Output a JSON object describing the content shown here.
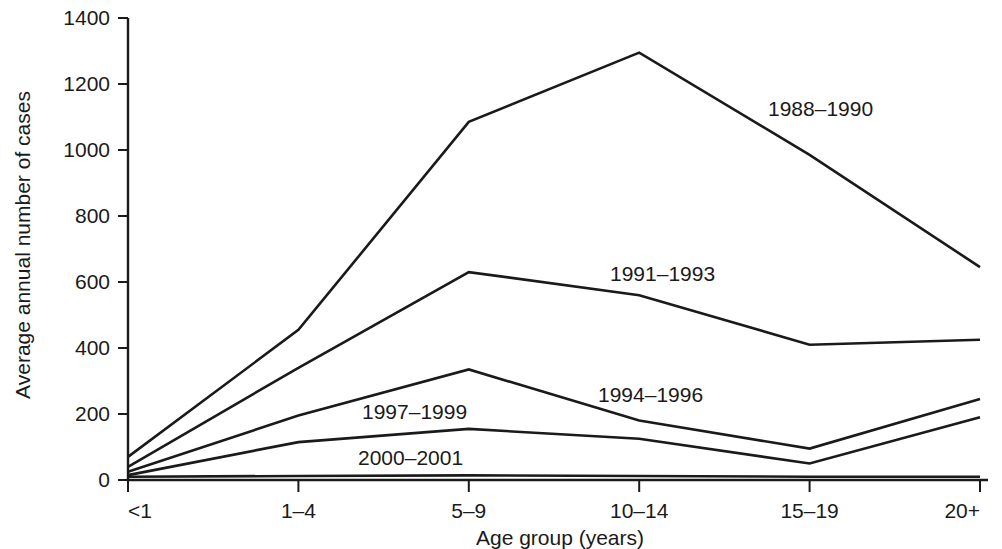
{
  "chart_data": {
    "type": "line",
    "title": "",
    "xlabel": "Age group (years)",
    "ylabel": "Average annual number of cases",
    "categories": [
      "<1",
      "1–4",
      "5–9",
      "10–14",
      "15–19",
      "20+"
    ],
    "ylim": [
      0,
      1400
    ],
    "yticks": [
      0,
      200,
      400,
      600,
      800,
      1000,
      1200,
      1400
    ],
    "ytick_labels": [
      "0",
      "200",
      "400",
      "600",
      "800",
      "1000",
      "1200",
      "1400"
    ],
    "grid": false,
    "legend_position": "inline-annotations",
    "series": [
      {
        "name": "1988–1990",
        "values": [
          70,
          455,
          1085,
          1295,
          985,
          645
        ],
        "color": "#1a1a1a",
        "label_x_category": "10–14",
        "label_value": 1140
      },
      {
        "name": "1991–1993",
        "values": [
          40,
          340,
          630,
          560,
          410,
          425
        ],
        "color": "#1a1a1a",
        "label_x_category": "5–9",
        "label_value": 680
      },
      {
        "name": "1994–1996",
        "values": [
          25,
          195,
          335,
          180,
          95,
          245
        ],
        "color": "#1a1a1a",
        "label_x_category": "10–14",
        "label_value": 290
      },
      {
        "name": "1997–1999",
        "values": [
          15,
          115,
          155,
          125,
          50,
          190
        ],
        "color": "#1a1a1a",
        "label_x_category": "1–4",
        "label_value": 225
      },
      {
        "name": "2000–2001",
        "values": [
          10,
          12,
          14,
          12,
          10,
          10
        ],
        "color": "#1a1a1a",
        "label_x_category": "1–4",
        "label_value": 100
      }
    ]
  },
  "annotations": [
    {
      "text": "1988–1990",
      "x": 768,
      "y": 116
    },
    {
      "text": "1991–1993",
      "x": 610,
      "y": 281
    },
    {
      "text": "1994–1996",
      "x": 598,
      "y": 402
    },
    {
      "text": "1997–1999",
      "x": 362,
      "y": 419
    },
    {
      "text": "2000–2001",
      "x": 358,
      "y": 465
    }
  ],
  "colors": {
    "line": "#1a1a1a",
    "axis": "#1a1a1a",
    "background": "#ffffff"
  }
}
